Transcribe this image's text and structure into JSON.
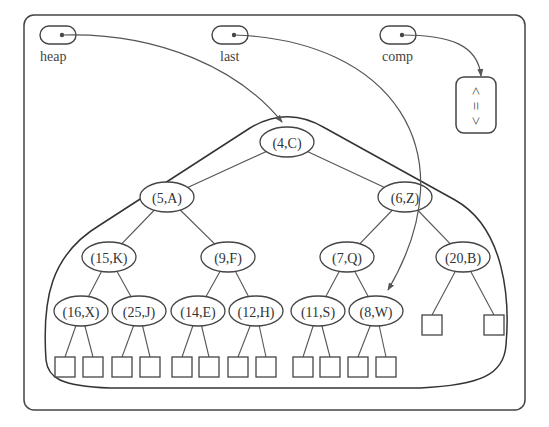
{
  "variables": [
    {
      "id": "heap",
      "label": "heap",
      "x": 62,
      "y": 35,
      "label_x": 40,
      "label_y": 61
    },
    {
      "id": "last",
      "label": "last",
      "x": 234,
      "y": 35,
      "label_x": 220,
      "label_y": 61
    },
    {
      "id": "comp",
      "label": "comp",
      "x": 402,
      "y": 35,
      "label_x": 382,
      "label_y": 61
    }
  ],
  "comparator": {
    "symbols": [
      "<",
      "=",
      ">"
    ]
  },
  "tree": {
    "nodes": [
      {
        "id": "n1",
        "label": "(4,C)",
        "x": 287,
        "y": 142
      },
      {
        "id": "n2",
        "label": "(5,A)",
        "x": 167,
        "y": 197
      },
      {
        "id": "n3",
        "label": "(6,Z)",
        "x": 405,
        "y": 197
      },
      {
        "id": "n4",
        "label": "(15,K)",
        "x": 109,
        "y": 257
      },
      {
        "id": "n5",
        "label": "(9,F)",
        "x": 228,
        "y": 257
      },
      {
        "id": "n6",
        "label": "(7,Q)",
        "x": 347,
        "y": 257
      },
      {
        "id": "n7",
        "label": "(20,B)",
        "x": 463,
        "y": 257
      },
      {
        "id": "n8",
        "label": "(16,X)",
        "x": 81,
        "y": 311
      },
      {
        "id": "n9",
        "label": "(25,J)",
        "x": 139,
        "y": 311
      },
      {
        "id": "n10",
        "label": "(14,E)",
        "x": 198,
        "y": 311
      },
      {
        "id": "n11",
        "label": "(12,H)",
        "x": 256,
        "y": 311
      },
      {
        "id": "n12",
        "label": "(11,S)",
        "x": 318,
        "y": 311
      },
      {
        "id": "n13",
        "label": "(8,W)",
        "x": 376,
        "y": 311
      }
    ],
    "edges": [
      [
        "n1",
        "n2"
      ],
      [
        "n1",
        "n3"
      ],
      [
        "n2",
        "n4"
      ],
      [
        "n2",
        "n5"
      ],
      [
        "n3",
        "n6"
      ],
      [
        "n3",
        "n7"
      ],
      [
        "n4",
        "n8"
      ],
      [
        "n4",
        "n9"
      ],
      [
        "n5",
        "n10"
      ],
      [
        "n5",
        "n11"
      ],
      [
        "n6",
        "n12"
      ],
      [
        "n6",
        "n13"
      ]
    ],
    "leaves": [
      {
        "parent": "n8",
        "x": 65
      },
      {
        "parent": "n8",
        "x": 93
      },
      {
        "parent": "n9",
        "x": 122
      },
      {
        "parent": "n9",
        "x": 150
      },
      {
        "parent": "n10",
        "x": 182
      },
      {
        "parent": "n10",
        "x": 209
      },
      {
        "parent": "n11",
        "x": 238
      },
      {
        "parent": "n11",
        "x": 266
      },
      {
        "parent": "n12",
        "x": 303
      },
      {
        "parent": "n12",
        "x": 330
      },
      {
        "parent": "n13",
        "x": 358
      },
      {
        "parent": "n13",
        "x": 386
      },
      {
        "parent": "n7",
        "x": 432,
        "y": 315
      },
      {
        "parent": "n7",
        "x": 494,
        "y": 315
      }
    ]
  },
  "pointers": {
    "heap_target": "n1",
    "last_target": "n13",
    "comp_target": "comparator"
  },
  "colors": {
    "stroke": "#444444",
    "text": "#333333",
    "background": "#ffffff"
  }
}
